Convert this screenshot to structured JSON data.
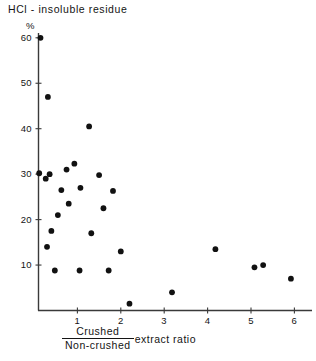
{
  "figure": {
    "title": "HCl - insoluble residue",
    "unit_label": "%"
  },
  "axis": {
    "x_title_numerator": "Crushed",
    "x_title_denominator": "Non-crushed",
    "x_title_suffix": "extract ratio",
    "y_title": "HCl - insoluble residue %"
  },
  "chart_data": {
    "type": "scatter",
    "title": "HCl - insoluble residue",
    "xlabel": "Crushed / Non-crushed extract ratio",
    "ylabel": "HCl - insoluble residue %",
    "xlim": [
      0,
      6.4
    ],
    "ylim": [
      0,
      62
    ],
    "xticks": [
      1,
      2,
      3,
      4,
      5,
      6
    ],
    "yticks": [
      10,
      20,
      30,
      40,
      50,
      60
    ],
    "xtick_labels": [
      "1",
      "2",
      "3",
      "4",
      "5",
      "6"
    ],
    "ytick_labels": [
      "10",
      "20",
      "30",
      "40",
      "50",
      "60"
    ],
    "grid": false,
    "legend": null,
    "marker": "filled-circle",
    "marker_color": "#111111",
    "points": [
      {
        "x": 0.15,
        "y": 60.0
      },
      {
        "x": 0.32,
        "y": 47.0
      },
      {
        "x": 1.27,
        "y": 40.5
      },
      {
        "x": 0.93,
        "y": 32.3
      },
      {
        "x": 0.12,
        "y": 30.2
      },
      {
        "x": 0.36,
        "y": 30.0
      },
      {
        "x": 0.75,
        "y": 31.0
      },
      {
        "x": 1.5,
        "y": 29.8
      },
      {
        "x": 0.27,
        "y": 29.0
      },
      {
        "x": 0.63,
        "y": 26.5
      },
      {
        "x": 1.07,
        "y": 27.0
      },
      {
        "x": 1.82,
        "y": 26.3
      },
      {
        "x": 0.8,
        "y": 23.5
      },
      {
        "x": 1.6,
        "y": 22.5
      },
      {
        "x": 0.55,
        "y": 21.0
      },
      {
        "x": 0.4,
        "y": 17.5
      },
      {
        "x": 1.32,
        "y": 17.0
      },
      {
        "x": 4.18,
        "y": 13.5
      },
      {
        "x": 0.3,
        "y": 14.0
      },
      {
        "x": 2.0,
        "y": 13.0
      },
      {
        "x": 5.08,
        "y": 9.5
      },
      {
        "x": 5.28,
        "y": 10.0
      },
      {
        "x": 0.48,
        "y": 8.8
      },
      {
        "x": 1.05,
        "y": 8.8
      },
      {
        "x": 1.72,
        "y": 8.8
      },
      {
        "x": 5.92,
        "y": 7.0
      },
      {
        "x": 3.18,
        "y": 4.0
      },
      {
        "x": 2.2,
        "y": 1.5
      }
    ]
  }
}
